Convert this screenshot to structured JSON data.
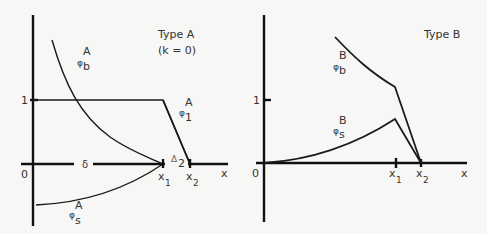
{
  "panels": [
    {
      "id": "type-a",
      "title": "Type A",
      "subtitle": "(k = 0)",
      "origin_label": "0",
      "y_tick_label": "1",
      "x_axis_label": "x",
      "x_ticks": [
        {
          "base": "x",
          "sub": "1"
        },
        {
          "base": "x",
          "sub": "2"
        }
      ],
      "gap_label": "δ",
      "delta_label": {
        "base": "Δ",
        "sub": "2"
      },
      "curves": [
        {
          "name": "phi_b_A",
          "symbol": "φ",
          "sub": "b",
          "sup": "A"
        },
        {
          "name": "phi_1_A",
          "symbol": "φ",
          "sub": "1",
          "sup": "A"
        },
        {
          "name": "phi_s_A",
          "symbol": "φ",
          "sub": "s",
          "sup": "A"
        }
      ]
    },
    {
      "id": "type-b",
      "title": "Type B",
      "origin_label": "0",
      "y_tick_label": "1",
      "x_axis_label": "x",
      "x_ticks": [
        {
          "base": "x",
          "sub": "1"
        },
        {
          "base": "x",
          "sub": "2"
        }
      ],
      "curves": [
        {
          "name": "phi_b_B",
          "symbol": "φ",
          "sub": "b",
          "sup": "B"
        },
        {
          "name": "phi_s_B",
          "symbol": "φ",
          "sub": "s",
          "sup": "B"
        }
      ]
    }
  ]
}
